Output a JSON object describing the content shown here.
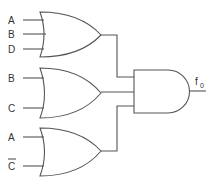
{
  "diagram": {
    "type": "logic-circuit",
    "gates": [
      {
        "id": "or1",
        "type": "OR",
        "inputs": [
          "A",
          "B",
          "D"
        ]
      },
      {
        "id": "or2",
        "type": "OR",
        "inputs": [
          "B",
          "C"
        ]
      },
      {
        "id": "or3",
        "type": "OR",
        "inputs": [
          "A",
          "C̄"
        ]
      },
      {
        "id": "and1",
        "type": "AND",
        "inputs": [
          "or1",
          "or2",
          "or3"
        ],
        "output": "f0"
      }
    ],
    "labels": {
      "or1_in1": "A",
      "or1_in2": "B",
      "or1_in3": "D",
      "or2_in1": "B",
      "or2_in2": "C",
      "or3_in1": "A",
      "or3_in2": "C",
      "output_main": "f",
      "output_sub": "0"
    }
  }
}
